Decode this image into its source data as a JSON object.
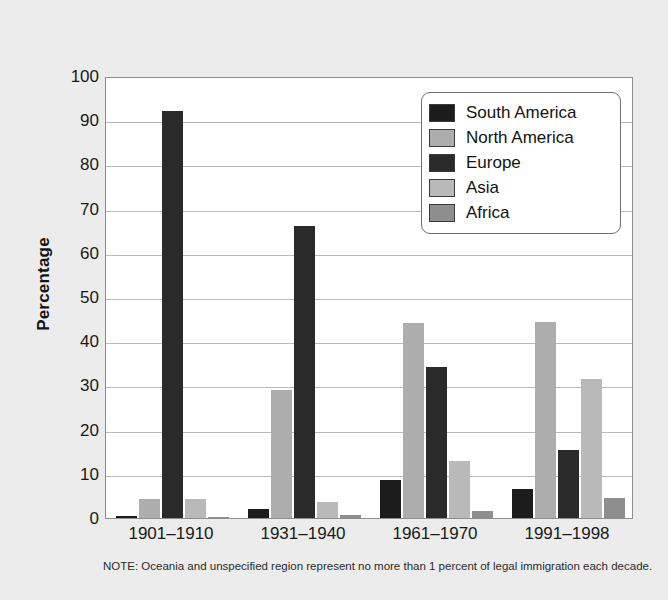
{
  "chart_data": {
    "type": "bar",
    "title": "",
    "xlabel": "",
    "ylabel": "Percentage",
    "ylim": [
      0,
      100
    ],
    "ytick_step": 10,
    "grid": true,
    "legend_position": "top-right",
    "categories": [
      "1901–1910",
      "1931–1940",
      "1961–1970",
      "1991–1998"
    ],
    "ytick_labels": [
      "100",
      "90",
      "80",
      "70",
      "60",
      "50",
      "40",
      "30",
      "20",
      "10",
      "0"
    ],
    "series": [
      {
        "name": "South America",
        "color": "#1c1c1c",
        "values": [
          0.4,
          2.0,
          8.5,
          6.5
        ]
      },
      {
        "name": "North America",
        "color": "#adadad",
        "values": [
          4.3,
          29.0,
          44.2,
          44.3
        ]
      },
      {
        "name": "Europe",
        "color": "#2a2a2a",
        "values": [
          92.0,
          66.0,
          34.2,
          15.3
        ]
      },
      {
        "name": "Asia",
        "color": "#b9b9b9",
        "values": [
          4.2,
          3.6,
          13.0,
          31.4
        ]
      },
      {
        "name": "Africa",
        "color": "#8e8e8e",
        "values": [
          0.3,
          0.6,
          1.5,
          4.5
        ]
      }
    ],
    "annotations": [
      "NOTE: Oceania and unspecified region represent no more than 1 percent of legal immigration each decade."
    ]
  },
  "figure": {
    "background_color": "#ececec",
    "plot_background_color": "#ffffff",
    "axis_color": "#8d8d8d",
    "gridline_color": "#b9b9b9"
  },
  "footnote": {
    "text": "NOTE: Oceania and unspecified region represent no more than 1 percent of legal immigration each decade."
  }
}
